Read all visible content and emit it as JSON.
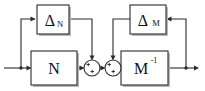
{
  "diagram": {
    "stroke_color": "#2b2b2b",
    "background_color": "#ffffff",
    "shadow_color": "#b9b9b9",
    "blocks": [
      {
        "id": "delta-n",
        "name": "delta-n-block",
        "symbol": "Δ",
        "subscript": "N",
        "superscript": "",
        "x": 37,
        "y": 5,
        "w": 32,
        "h": 29
      },
      {
        "id": "delta-m",
        "name": "delta-m-block",
        "symbol": "Δ",
        "subscript": "M",
        "superscript": "",
        "x": 130,
        "y": 5,
        "w": 36,
        "h": 29
      },
      {
        "id": "n",
        "name": "n-block",
        "symbol": "N",
        "subscript": "",
        "superscript": "",
        "x": 31,
        "y": 51,
        "w": 46,
        "h": 34
      },
      {
        "id": "m-inv",
        "name": "m-inverse-block",
        "symbol": "M",
        "subscript": "",
        "superscript": "-1",
        "x": 121,
        "y": 51,
        "w": 47,
        "h": 34
      }
    ],
    "summing_junctions": [
      {
        "id": "sum-1",
        "name": "summing-junction-1",
        "cx": 92,
        "cy": 68,
        "r": 8,
        "signs": [
          "+",
          "+"
        ]
      },
      {
        "id": "sum-2",
        "name": "summing-junction-2",
        "cx": 113,
        "cy": 68,
        "r": 8,
        "signs": [
          "+",
          "+"
        ]
      }
    ],
    "signals": {
      "input_label": "",
      "output_label": ""
    }
  }
}
